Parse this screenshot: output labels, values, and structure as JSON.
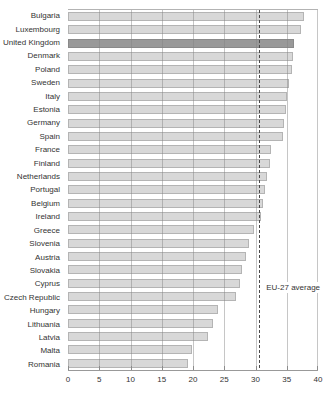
{
  "chart_data": {
    "type": "bar",
    "orientation": "horizontal",
    "title": "",
    "xlabel": "",
    "ylabel": "",
    "categories": [
      "Bulgaria",
      "Luxembourg",
      "United Kingdom",
      "Denmark",
      "Poland",
      "Sweden",
      "Italy",
      "Estonia",
      "Germany",
      "Spain",
      "France",
      "Finland",
      "Netherlands",
      "Portugal",
      "Belgium",
      "Ireland",
      "Greece",
      "Slovenia",
      "Austria",
      "Slovakia",
      "Cyprus",
      "Czech Republic",
      "Hungary",
      "Lithuania",
      "Latvia",
      "Malta",
      "Romania"
    ],
    "values": [
      37.8,
      37.2,
      36.2,
      36.0,
      35.8,
      35.3,
      35.0,
      34.8,
      34.6,
      34.4,
      32.5,
      32.3,
      31.8,
      31.5,
      31.2,
      30.8,
      29.8,
      28.9,
      28.4,
      27.9,
      27.5,
      26.8,
      24.0,
      23.2,
      22.4,
      19.8,
      19.2
    ],
    "highlight_category": "United Kingdom",
    "reference_line": {
      "label": "EU-27 average",
      "value": 30.6
    },
    "xlim": [
      0,
      40
    ],
    "x_ticks": [
      0,
      5,
      10,
      15,
      20,
      25,
      30,
      35,
      40
    ],
    "grid": "vertical",
    "legend": "none",
    "colors": {
      "bar": "#d8d8d8",
      "bar_border": "#b4b4b4",
      "highlight_bar": "#999999",
      "gridline": "#b3b3b3",
      "axis_line": "#999999",
      "text": "#333333",
      "reference_line": "#4a4a4a"
    }
  }
}
